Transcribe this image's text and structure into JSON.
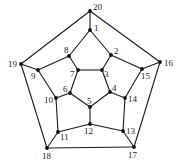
{
  "graph": {
    "name": "dodecahedral graph",
    "vertex_color": "#111111",
    "edge_color": "#1a1a1a",
    "vertices": [
      {
        "id": "1",
        "x": 90,
        "y": 30,
        "lx": 94,
        "ly": 31
      },
      {
        "id": "2",
        "x": 111,
        "y": 55,
        "lx": 114,
        "ly": 54
      },
      {
        "id": "3",
        "x": 102,
        "y": 70,
        "lx": 104,
        "ly": 77
      },
      {
        "id": "4",
        "x": 110,
        "y": 92,
        "lx": 112,
        "ly": 91
      },
      {
        "id": "5",
        "x": 90,
        "y": 107,
        "lx": 87,
        "ly": 104
      },
      {
        "id": "6",
        "x": 70,
        "y": 93,
        "lx": 63,
        "ly": 92
      },
      {
        "id": "7",
        "x": 78,
        "y": 70,
        "lx": 70,
        "ly": 77
      },
      {
        "id": "8",
        "x": 69,
        "y": 56,
        "lx": 64,
        "ly": 53
      },
      {
        "id": "9",
        "x": 38,
        "y": 70,
        "lx": 31,
        "ly": 79
      },
      {
        "id": "10",
        "x": 56,
        "y": 98,
        "lx": 44,
        "ly": 103
      },
      {
        "id": "11",
        "x": 58,
        "y": 132,
        "lx": 60,
        "ly": 140
      },
      {
        "id": "12",
        "x": 90,
        "y": 124,
        "lx": 84,
        "ly": 134
      },
      {
        "id": "13",
        "x": 123,
        "y": 131,
        "lx": 126,
        "ly": 134
      },
      {
        "id": "14",
        "x": 125,
        "y": 98,
        "lx": 128,
        "ly": 102
      },
      {
        "id": "15",
        "x": 142,
        "y": 69,
        "lx": 141,
        "ly": 79
      },
      {
        "id": "16",
        "x": 160,
        "y": 62,
        "lx": 164,
        "ly": 66
      },
      {
        "id": "17",
        "x": 134,
        "y": 147,
        "lx": 128,
        "ly": 158
      },
      {
        "id": "18",
        "x": 47,
        "y": 148,
        "lx": 42,
        "ly": 159
      },
      {
        "id": "19",
        "x": 21,
        "y": 64,
        "lx": 8,
        "ly": 67
      },
      {
        "id": "20",
        "x": 90,
        "y": 11,
        "lx": 93,
        "ly": 10
      }
    ],
    "edges": [
      [
        "20",
        "16"
      ],
      [
        "16",
        "17"
      ],
      [
        "17",
        "18"
      ],
      [
        "18",
        "19"
      ],
      [
        "19",
        "20"
      ],
      [
        "20",
        "1"
      ],
      [
        "16",
        "15"
      ],
      [
        "17",
        "13"
      ],
      [
        "18",
        "11"
      ],
      [
        "19",
        "9"
      ],
      [
        "1",
        "2"
      ],
      [
        "2",
        "15"
      ],
      [
        "15",
        "14"
      ],
      [
        "14",
        "13"
      ],
      [
        "13",
        "12"
      ],
      [
        "12",
        "11"
      ],
      [
        "11",
        "10"
      ],
      [
        "10",
        "9"
      ],
      [
        "9",
        "8"
      ],
      [
        "8",
        "1"
      ],
      [
        "2",
        "3"
      ],
      [
        "14",
        "4"
      ],
      [
        "12",
        "5"
      ],
      [
        "10",
        "6"
      ],
      [
        "8",
        "7"
      ],
      [
        "3",
        "4"
      ],
      [
        "4",
        "5"
      ],
      [
        "5",
        "6"
      ],
      [
        "6",
        "7"
      ],
      [
        "7",
        "3"
      ]
    ]
  },
  "caption": {
    "text": "",
    "note": "faint cropped caption text at bottom, illegible"
  }
}
